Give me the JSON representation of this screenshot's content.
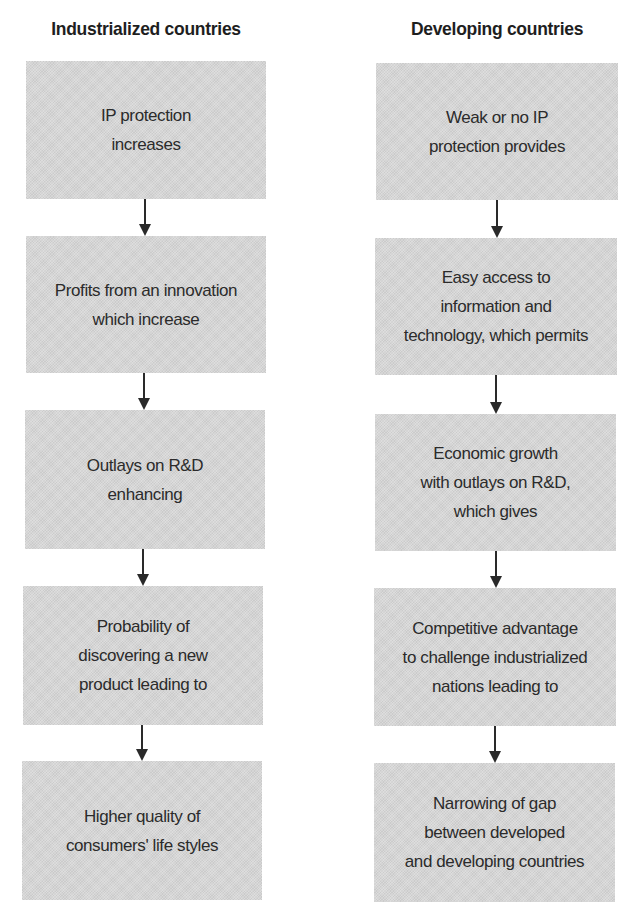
{
  "columns": {
    "industrialized": {
      "title": "Industrialized countries",
      "steps": [
        "IP protection\nincreases",
        "Profits from an innovation\nwhich increase",
        "Outlays on R&D\nenhancing",
        "Probability of\ndiscovering a new\nproduct leading to",
        "Higher quality of\nconsumers' life styles"
      ]
    },
    "developing": {
      "title": "Developing countries",
      "steps": [
        "Weak or no IP\nprotection provides",
        "Easy access to\ninformation and\ntechnology, which permits",
        "Economic growth\nwith outlays on R&D,\nwhich gives",
        "Competitive advantage\nto challenge industrialized\nnations leading to",
        "Narrowing of gap\nbetween developed\nand developing countries"
      ]
    }
  },
  "colors": {
    "box_fill": "#d6d6d6",
    "text": "#2b2b2b",
    "arrow": "#2a2a2a",
    "background": "#ffffff"
  }
}
